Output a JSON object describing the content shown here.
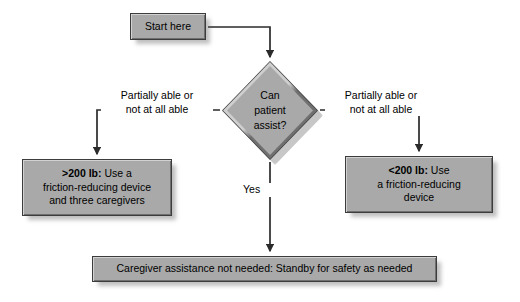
{
  "diagram": {
    "type": "flowchart",
    "palette": {
      "node_fill": "#a9a9a9",
      "node_border": "#3c3c3c",
      "node_highlight": "#d2d2d2",
      "node_lowlight": "#6f6f6f",
      "connector": "#2b2b2b",
      "background": "#ffffff",
      "text": "#000000"
    },
    "nodes": {
      "start": {
        "shape": "rectangle",
        "text": "Start here"
      },
      "decision": {
        "shape": "diamond",
        "line1": "Can",
        "line2": "patient",
        "line3": "assist?"
      },
      "left_outcome": {
        "shape": "rectangle",
        "emphasis": ">200 lb:",
        "line1_rest": " Use a",
        "line2": "friction-reducing device",
        "line3": "and three caregivers"
      },
      "right_outcome": {
        "shape": "rectangle",
        "emphasis": "<200 lb:",
        "line1_rest": " Use",
        "line2": "a friction-reducing",
        "line3": "device"
      },
      "bottom": {
        "shape": "rectangle",
        "text": "Caregiver assistance not needed: Standby for safety as needed"
      }
    },
    "edge_labels": {
      "left_branch_line1": "Partially able or",
      "left_branch_line2": "not at all able",
      "right_branch_line1": "Partially able or",
      "right_branch_line2": "not at all able",
      "center_branch": "Yes"
    }
  }
}
